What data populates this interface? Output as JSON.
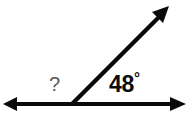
{
  "figure": {
    "background_color": "#ffffff",
    "stroke_color": "#0a0a0a",
    "unknown_label_color": "#585858"
  },
  "labels": {
    "known_angle_value": "48",
    "degree_symbol": "°",
    "unknown_angle": "?"
  },
  "geometry": {
    "vertex": {
      "x": 72,
      "y": 104
    },
    "baseline_left_tip": {
      "x": 3,
      "y": 104
    },
    "baseline_right_tip": {
      "x": 186,
      "y": 104
    },
    "upper_ray_tip": {
      "x": 169,
      "y": 6
    },
    "known_angle_degrees": 48,
    "unknown_angle_degrees": 132,
    "line_thickness": 4.2,
    "arrowhead_length": 15,
    "arrowhead_halfwidth": 7
  }
}
